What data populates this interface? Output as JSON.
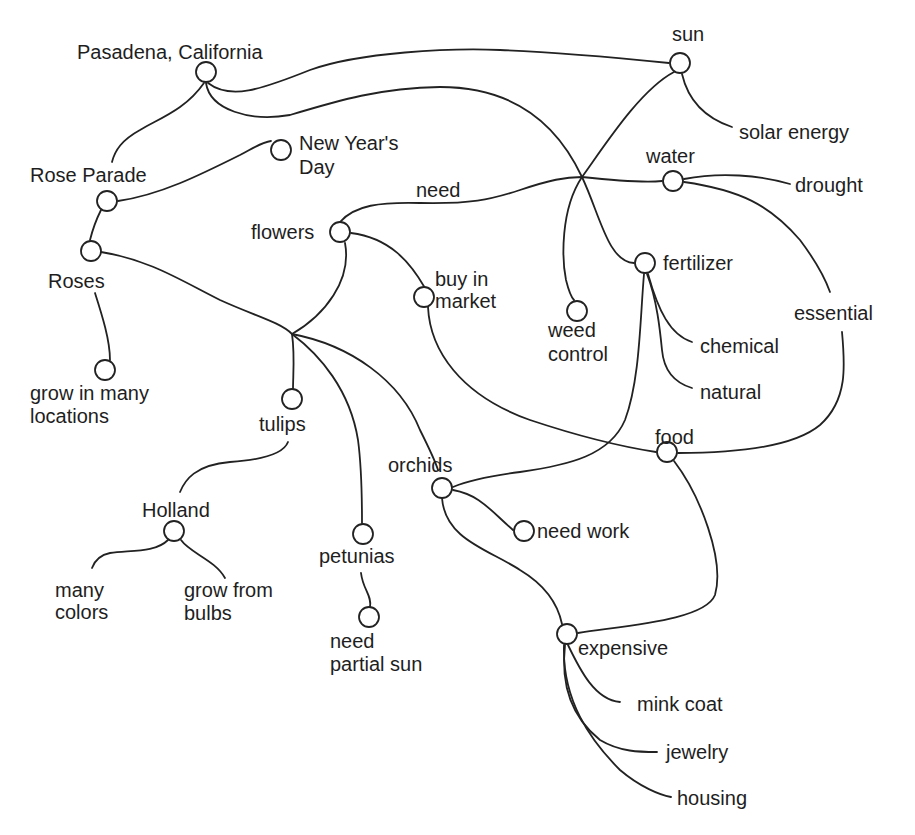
{
  "diagram": {
    "type": "semantic-web / mind map",
    "colors": {
      "line": "#222222",
      "text": "#1e1e1e",
      "background": "#ffffff"
    },
    "nodes": [
      {
        "id": "pasadena",
        "label": "Pasadena, California"
      },
      {
        "id": "sun",
        "label": "sun"
      },
      {
        "id": "solar_energy",
        "label": "solar energy"
      },
      {
        "id": "rose_parade",
        "label": "Rose Parade"
      },
      {
        "id": "new_years_day",
        "label_line1": "New Year's",
        "label_line2": "Day"
      },
      {
        "id": "roses",
        "label": "Roses"
      },
      {
        "id": "grow_many_locations",
        "label_line1": "grow in many",
        "label_line2": "locations"
      },
      {
        "id": "flowers",
        "label": "flowers"
      },
      {
        "id": "water",
        "label": "water"
      },
      {
        "id": "drought",
        "label": "drought"
      },
      {
        "id": "buy_in_market",
        "label_line1": "buy in",
        "label_line2": "market"
      },
      {
        "id": "weed_control",
        "label_line1": "weed",
        "label_line2": "control"
      },
      {
        "id": "fertilizer",
        "label": "fertilizer"
      },
      {
        "id": "essential",
        "label": "essential"
      },
      {
        "id": "chemical",
        "label": "chemical"
      },
      {
        "id": "natural",
        "label": "natural"
      },
      {
        "id": "tulips",
        "label": "tulips"
      },
      {
        "id": "holland",
        "label": "Holland"
      },
      {
        "id": "many_colors",
        "label_line1": "many",
        "label_line2": "colors"
      },
      {
        "id": "grow_from_bulbs",
        "label_line1": "grow from",
        "label_line2": "bulbs"
      },
      {
        "id": "orchids",
        "label": "orchids"
      },
      {
        "id": "need_work",
        "label": "need work"
      },
      {
        "id": "petunias",
        "label": "petunias"
      },
      {
        "id": "need_partial_sun",
        "label_line1": "need",
        "label_line2": "partial sun"
      },
      {
        "id": "food",
        "label": "food"
      },
      {
        "id": "expensive",
        "label": "expensive"
      },
      {
        "id": "mink_coat",
        "label": "mink coat"
      },
      {
        "id": "jewelry",
        "label": "jewelry"
      },
      {
        "id": "housing",
        "label": "housing"
      }
    ],
    "edge_labels": {
      "need": "need"
    },
    "edges": [
      [
        "pasadena",
        "sun"
      ],
      [
        "pasadena",
        "fertilizer"
      ],
      [
        "pasadena",
        "rose_parade"
      ],
      [
        "sun",
        "solar_energy"
      ],
      [
        "sun",
        "weed_control"
      ],
      [
        "rose_parade",
        "new_years_day"
      ],
      [
        "rose_parade",
        "roses"
      ],
      [
        "roses",
        "grow_many_locations"
      ],
      [
        "roses",
        "tulips"
      ],
      [
        "flowers",
        "water"
      ],
      [
        "flowers",
        "buy_in_market"
      ],
      [
        "flowers",
        "tulips"
      ],
      [
        "water",
        "drought"
      ],
      [
        "water",
        "essential"
      ],
      [
        "essential",
        "food"
      ],
      [
        "buy_in_market",
        "food"
      ],
      [
        "fertilizer",
        "chemical"
      ],
      [
        "fertilizer",
        "natural"
      ],
      [
        "fertilizer",
        "orchids"
      ],
      [
        "tulips",
        "holland"
      ],
      [
        "holland",
        "many_colors"
      ],
      [
        "holland",
        "grow_from_bulbs"
      ],
      [
        "orchids",
        "need_work"
      ],
      [
        "orchids",
        "expensive"
      ],
      [
        "petunias",
        "need_partial_sun"
      ],
      [
        "food",
        "expensive"
      ],
      [
        "expensive",
        "mink_coat"
      ],
      [
        "expensive",
        "jewelry"
      ],
      [
        "expensive",
        "housing"
      ]
    ]
  }
}
